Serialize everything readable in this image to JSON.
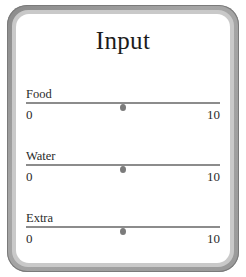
{
  "panel": {
    "title": "Input"
  },
  "sliders": [
    {
      "label": "Food",
      "min": "0",
      "max": "10",
      "value": 5
    },
    {
      "label": "Water",
      "min": "0",
      "max": "10",
      "value": 5
    },
    {
      "label": "Extra",
      "min": "0",
      "max": "10",
      "value": 5
    }
  ],
  "colors": {
    "frame": "#9a9a9a",
    "track": "#8c8c8c",
    "thumb": "#7b7b7b",
    "text": "#2a2a2a"
  }
}
